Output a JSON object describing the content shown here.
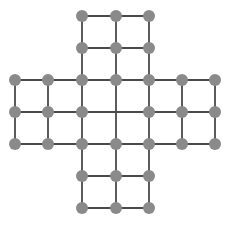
{
  "figure": {
    "name": "cross-shaped-grid-graph",
    "title": "",
    "background_color": "#ffffff",
    "width": 237,
    "height": 225
  },
  "style": {
    "node_color": "#8a8a8a",
    "node_radius": 6,
    "edge_color": "#4a4a4a",
    "edge_width": 1.8
  },
  "chart_data": {
    "type": "scatter",
    "title": "",
    "subtitle": "",
    "xlabel": "",
    "ylabel": "",
    "xlim": [
      0,
      237
    ],
    "ylim": [
      0,
      225
    ],
    "grid": false,
    "legend": null,
    "lattice": {
      "columns_x": [
        15,
        48,
        82,
        116,
        149,
        182,
        215
      ],
      "rows_y": [
        16,
        48,
        80,
        112,
        144,
        176,
        208
      ],
      "n_cols": 7,
      "n_rows": 7,
      "shape": "plus",
      "arm_width_cells": 2,
      "missing_vertices": [
        [
          3,
          3
        ]
      ]
    },
    "node_count": 40,
    "edge_count": 76,
    "nodes": [
      {
        "col": 2,
        "row": 0,
        "x": 82,
        "y": 16
      },
      {
        "col": 3,
        "row": 0,
        "x": 116,
        "y": 16
      },
      {
        "col": 4,
        "row": 0,
        "x": 149,
        "y": 16
      },
      {
        "col": 2,
        "row": 1,
        "x": 82,
        "y": 48
      },
      {
        "col": 3,
        "row": 1,
        "x": 116,
        "y": 48
      },
      {
        "col": 4,
        "row": 1,
        "x": 149,
        "y": 48
      },
      {
        "col": 0,
        "row": 2,
        "x": 15,
        "y": 80
      },
      {
        "col": 1,
        "row": 2,
        "x": 48,
        "y": 80
      },
      {
        "col": 2,
        "row": 2,
        "x": 82,
        "y": 80
      },
      {
        "col": 3,
        "row": 2,
        "x": 116,
        "y": 80
      },
      {
        "col": 4,
        "row": 2,
        "x": 149,
        "y": 80
      },
      {
        "col": 5,
        "row": 2,
        "x": 182,
        "y": 80
      },
      {
        "col": 6,
        "row": 2,
        "x": 215,
        "y": 80
      },
      {
        "col": 0,
        "row": 3,
        "x": 15,
        "y": 112
      },
      {
        "col": 1,
        "row": 3,
        "x": 48,
        "y": 112
      },
      {
        "col": 2,
        "row": 3,
        "x": 82,
        "y": 112
      },
      {
        "col": 4,
        "row": 3,
        "x": 149,
        "y": 112
      },
      {
        "col": 5,
        "row": 3,
        "x": 182,
        "y": 112
      },
      {
        "col": 6,
        "row": 3,
        "x": 215,
        "y": 112
      },
      {
        "col": 0,
        "row": 4,
        "x": 15,
        "y": 144
      },
      {
        "col": 1,
        "row": 4,
        "x": 48,
        "y": 144
      },
      {
        "col": 2,
        "row": 4,
        "x": 82,
        "y": 144
      },
      {
        "col": 3,
        "row": 4,
        "x": 116,
        "y": 144
      },
      {
        "col": 4,
        "row": 4,
        "x": 149,
        "y": 144
      },
      {
        "col": 5,
        "row": 4,
        "x": 182,
        "y": 144
      },
      {
        "col": 6,
        "row": 4,
        "x": 215,
        "y": 144
      },
      {
        "col": 2,
        "row": 5,
        "x": 82,
        "y": 176
      },
      {
        "col": 3,
        "row": 5,
        "x": 116,
        "y": 176
      },
      {
        "col": 4,
        "row": 5,
        "x": 149,
        "y": 176
      },
      {
        "col": 2,
        "row": 6,
        "x": 82,
        "y": 208
      },
      {
        "col": 3,
        "row": 6,
        "x": 116,
        "y": 208
      },
      {
        "col": 4,
        "row": 6,
        "x": 149,
        "y": 208
      }
    ],
    "edges": [
      {
        "x1": 82,
        "y1": 16,
        "x2": 116,
        "y2": 16
      },
      {
        "x1": 116,
        "y1": 16,
        "x2": 149,
        "y2": 16
      },
      {
        "x1": 82,
        "y1": 48,
        "x2": 116,
        "y2": 48
      },
      {
        "x1": 116,
        "y1": 48,
        "x2": 149,
        "y2": 48
      },
      {
        "x1": 15,
        "y1": 80,
        "x2": 48,
        "y2": 80
      },
      {
        "x1": 48,
        "y1": 80,
        "x2": 82,
        "y2": 80
      },
      {
        "x1": 82,
        "y1": 80,
        "x2": 116,
        "y2": 80
      },
      {
        "x1": 116,
        "y1": 80,
        "x2": 149,
        "y2": 80
      },
      {
        "x1": 149,
        "y1": 80,
        "x2": 182,
        "y2": 80
      },
      {
        "x1": 182,
        "y1": 80,
        "x2": 215,
        "y2": 80
      },
      {
        "x1": 15,
        "y1": 112,
        "x2": 48,
        "y2": 112
      },
      {
        "x1": 48,
        "y1": 112,
        "x2": 82,
        "y2": 112
      },
      {
        "x1": 82,
        "y1": 112,
        "x2": 116,
        "y2": 112
      },
      {
        "x1": 116,
        "y1": 112,
        "x2": 149,
        "y2": 112
      },
      {
        "x1": 149,
        "y1": 112,
        "x2": 182,
        "y2": 112
      },
      {
        "x1": 182,
        "y1": 112,
        "x2": 215,
        "y2": 112
      },
      {
        "x1": 15,
        "y1": 144,
        "x2": 48,
        "y2": 144
      },
      {
        "x1": 48,
        "y1": 144,
        "x2": 82,
        "y2": 144
      },
      {
        "x1": 82,
        "y1": 144,
        "x2": 116,
        "y2": 144
      },
      {
        "x1": 116,
        "y1": 144,
        "x2": 149,
        "y2": 144
      },
      {
        "x1": 149,
        "y1": 144,
        "x2": 182,
        "y2": 144
      },
      {
        "x1": 182,
        "y1": 144,
        "x2": 215,
        "y2": 144
      },
      {
        "x1": 82,
        "y1": 176,
        "x2": 116,
        "y2": 176
      },
      {
        "x1": 116,
        "y1": 176,
        "x2": 149,
        "y2": 176
      },
      {
        "x1": 82,
        "y1": 208,
        "x2": 116,
        "y2": 208
      },
      {
        "x1": 116,
        "y1": 208,
        "x2": 149,
        "y2": 208
      },
      {
        "x1": 82,
        "y1": 16,
        "x2": 82,
        "y2": 48
      },
      {
        "x1": 116,
        "y1": 16,
        "x2": 116,
        "y2": 48
      },
      {
        "x1": 149,
        "y1": 16,
        "x2": 149,
        "y2": 48
      },
      {
        "x1": 82,
        "y1": 48,
        "x2": 82,
        "y2": 80
      },
      {
        "x1": 116,
        "y1": 48,
        "x2": 116,
        "y2": 80
      },
      {
        "x1": 149,
        "y1": 48,
        "x2": 149,
        "y2": 80
      },
      {
        "x1": 15,
        "y1": 80,
        "x2": 15,
        "y2": 112
      },
      {
        "x1": 48,
        "y1": 80,
        "x2": 48,
        "y2": 112
      },
      {
        "x1": 82,
        "y1": 80,
        "x2": 82,
        "y2": 112
      },
      {
        "x1": 116,
        "y1": 80,
        "x2": 116,
        "y2": 112
      },
      {
        "x1": 149,
        "y1": 80,
        "x2": 149,
        "y2": 112
      },
      {
        "x1": 182,
        "y1": 80,
        "x2": 182,
        "y2": 112
      },
      {
        "x1": 215,
        "y1": 80,
        "x2": 215,
        "y2": 112
      },
      {
        "x1": 15,
        "y1": 112,
        "x2": 15,
        "y2": 144
      },
      {
        "x1": 48,
        "y1": 112,
        "x2": 48,
        "y2": 144
      },
      {
        "x1": 82,
        "y1": 112,
        "x2": 82,
        "y2": 144
      },
      {
        "x1": 116,
        "y1": 112,
        "x2": 116,
        "y2": 144
      },
      {
        "x1": 149,
        "y1": 112,
        "x2": 149,
        "y2": 144
      },
      {
        "x1": 182,
        "y1": 112,
        "x2": 182,
        "y2": 144
      },
      {
        "x1": 215,
        "y1": 112,
        "x2": 215,
        "y2": 144
      },
      {
        "x1": 82,
        "y1": 144,
        "x2": 82,
        "y2": 176
      },
      {
        "x1": 116,
        "y1": 144,
        "x2": 116,
        "y2": 176
      },
      {
        "x1": 149,
        "y1": 144,
        "x2": 149,
        "y2": 176
      },
      {
        "x1": 82,
        "y1": 176,
        "x2": 82,
        "y2": 208
      },
      {
        "x1": 116,
        "y1": 176,
        "x2": 116,
        "y2": 208
      },
      {
        "x1": 149,
        "y1": 176,
        "x2": 149,
        "y2": 208
      }
    ]
  }
}
